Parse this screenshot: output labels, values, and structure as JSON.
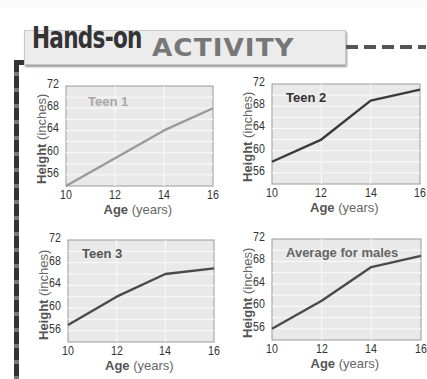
{
  "header": {
    "title_script": "Hands-on",
    "title_block": "ACTIVITY"
  },
  "axis": {
    "y_label_bold": "Height",
    "y_label_rest": "(inches)",
    "x_label_bold": "Age",
    "x_label_rest": "(years)"
  },
  "chart_data": [
    {
      "type": "line",
      "title": "Teen 1",
      "xlabel": "Age (years)",
      "ylabel": "Height (inches)",
      "x": [
        10,
        12,
        14,
        16
      ],
      "values": [
        54,
        59,
        64,
        68
      ],
      "xlim": [
        10,
        16
      ],
      "ylim": [
        54,
        72
      ],
      "yticks": [
        56,
        60,
        64,
        68,
        72
      ],
      "xticks": [
        10,
        12,
        14,
        16
      ],
      "grid": true,
      "line_color": "#9a9a9a",
      "title_color": "#a8a8a8"
    },
    {
      "type": "line",
      "title": "Teen 2",
      "xlabel": "Age (years)",
      "ylabel": "Height (inches)",
      "x": [
        10,
        12,
        14,
        16
      ],
      "values": [
        58,
        62,
        69,
        71
      ],
      "xlim": [
        10,
        16
      ],
      "ylim": [
        54,
        72
      ],
      "yticks": [
        56,
        60,
        64,
        68,
        72
      ],
      "xticks": [
        10,
        12,
        14,
        16
      ],
      "grid": true,
      "line_color": "#3a3a3a",
      "title_color": "#333333"
    },
    {
      "type": "line",
      "title": "Teen 3",
      "xlabel": "Age (years)",
      "ylabel": "Height (inches)",
      "x": [
        10,
        12,
        14,
        16
      ],
      "values": [
        57,
        62,
        66,
        67
      ],
      "xlim": [
        10,
        16
      ],
      "ylim": [
        54,
        72
      ],
      "yticks": [
        56,
        60,
        64,
        68,
        72
      ],
      "xticks": [
        10,
        12,
        14,
        16
      ],
      "grid": true,
      "line_color": "#4a4a4a",
      "title_color": "#555555"
    },
    {
      "type": "line",
      "title": "Average for males",
      "xlabel": "Age (years)",
      "ylabel": "Height (inches)",
      "x": [
        10,
        12,
        14,
        16
      ],
      "values": [
        56,
        61,
        67,
        69
      ],
      "xlim": [
        10,
        16
      ],
      "ylim": [
        54,
        72
      ],
      "yticks": [
        56,
        60,
        64,
        68,
        72
      ],
      "xticks": [
        10,
        12,
        14,
        16
      ],
      "grid": true,
      "line_color": "#4a4a4a",
      "title_color": "#666666"
    }
  ],
  "layout": [
    {
      "left": 66,
      "top": 86,
      "width": 147,
      "height": 100
    },
    {
      "left": 272,
      "top": 84,
      "width": 148,
      "height": 100
    },
    {
      "left": 68,
      "top": 240,
      "width": 146,
      "height": 102
    },
    {
      "left": 272,
      "top": 239,
      "width": 149,
      "height": 101
    }
  ]
}
